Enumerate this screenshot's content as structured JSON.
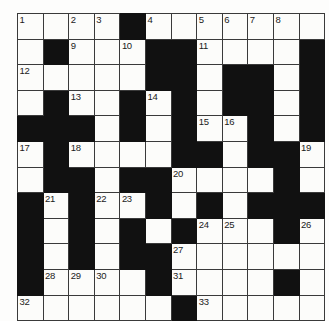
{
  "puzzle": {
    "type": "crossword-grid",
    "title": "Crossword Puzzle Grid",
    "rows": 12,
    "columns": 12,
    "cell_size_px": 24.6,
    "colors": {
      "block": "#111111",
      "cell": "#fcfcfa",
      "grid_line": "#3a3a3a",
      "number_text": "#1b1b1b",
      "page_background": "#ffffff"
    },
    "highest_clue_number": 33,
    "legend": {
      "0": "white (fillable) cell",
      "1": "black (blocked) cell"
    },
    "blocks": [
      [
        0,
        0,
        0,
        0,
        1,
        0,
        0,
        0,
        0,
        0,
        0,
        0
      ],
      [
        0,
        1,
        0,
        0,
        0,
        1,
        1,
        0,
        0,
        0,
        0,
        1
      ],
      [
        0,
        0,
        0,
        0,
        0,
        1,
        1,
        0,
        1,
        1,
        0,
        1
      ],
      [
        0,
        1,
        0,
        0,
        1,
        0,
        1,
        0,
        1,
        1,
        0,
        1
      ],
      [
        1,
        1,
        1,
        0,
        1,
        0,
        1,
        0,
        0,
        1,
        0,
        1
      ],
      [
        0,
        1,
        0,
        0,
        0,
        0,
        1,
        1,
        0,
        1,
        1,
        0
      ],
      [
        0,
        1,
        1,
        0,
        1,
        1,
        0,
        0,
        0,
        0,
        1,
        0
      ],
      [
        1,
        0,
        1,
        0,
        0,
        1,
        0,
        1,
        0,
        1,
        1,
        1
      ],
      [
        1,
        0,
        1,
        0,
        1,
        0,
        1,
        0,
        0,
        0,
        1,
        0
      ],
      [
        1,
        0,
        1,
        0,
        1,
        1,
        0,
        0,
        0,
        0,
        0,
        0
      ],
      [
        1,
        0,
        0,
        0,
        0,
        1,
        0,
        0,
        0,
        0,
        1,
        0
      ],
      [
        0,
        0,
        0,
        0,
        0,
        0,
        1,
        0,
        0,
        0,
        0,
        0
      ]
    ],
    "numbers": [
      [
        "1",
        "",
        "2",
        "3",
        "",
        "4",
        "",
        "5",
        "6",
        "7",
        "8",
        ""
      ],
      [
        "",
        "",
        "9",
        "",
        "10",
        "",
        "",
        "11",
        "",
        "",
        "",
        ""
      ],
      [
        "12",
        "",
        "",
        "",
        "",
        "",
        "",
        "",
        "",
        "",
        "",
        ""
      ],
      [
        "",
        "",
        "13",
        "",
        "",
        "14",
        "",
        "",
        "",
        "",
        "",
        ""
      ],
      [
        "",
        "",
        "",
        "",
        "",
        "",
        "",
        "15",
        "16",
        "",
        "",
        ""
      ],
      [
        "17",
        "",
        "18",
        "",
        "",
        "",
        "",
        "",
        "",
        "",
        "",
        "19"
      ],
      [
        "",
        "",
        "",
        "",
        "",
        "",
        "20",
        "",
        "",
        "",
        "",
        ""
      ],
      [
        "",
        "21",
        "",
        "22",
        "23",
        "",
        "",
        "",
        "",
        "",
        "",
        ""
      ],
      [
        "",
        "",
        "",
        "",
        "",
        "",
        "",
        "24",
        "25",
        "",
        "",
        "26"
      ],
      [
        "",
        "",
        "",
        "",
        "",
        "",
        "27",
        "",
        "",
        "",
        "",
        ""
      ],
      [
        "",
        "28",
        "29",
        "30",
        "",
        "",
        "31",
        "",
        "",
        "",
        "",
        ""
      ],
      [
        "32",
        "",
        "",
        "",
        "",
        "",
        "",
        "33",
        "",
        "",
        "",
        ""
      ]
    ]
  }
}
